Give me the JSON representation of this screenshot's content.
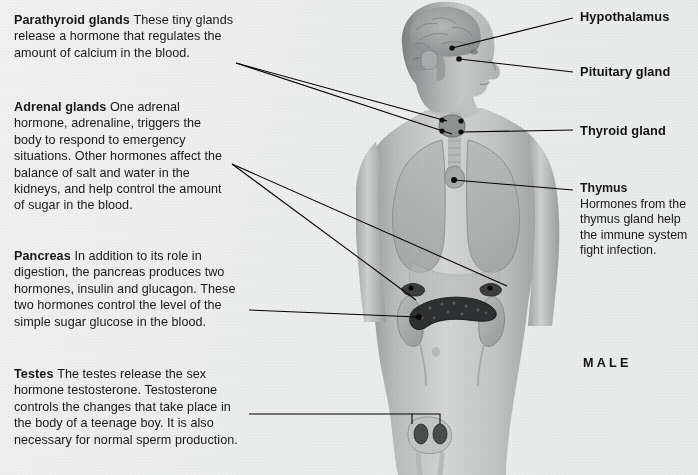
{
  "page": {
    "background_color": "#ececec",
    "figure_caption": "MALE",
    "text_color": "#17181a"
  },
  "left_callouts": [
    {
      "id": "parathyroid",
      "heading": "Parathyroid glands",
      "body": "These tiny glands release a hormone that regulates the amount of calcium in the blood."
    },
    {
      "id": "adrenal",
      "heading": "Adrenal glands",
      "body": "One adrenal hormone, adrenaline, triggers the body to respond to emergency situations. Other hormones affect the balance of salt and water in the kidneys, and help control the amount of sugar in the blood."
    },
    {
      "id": "pancreas",
      "heading": "Pancreas",
      "body": "In addition to its role in digestion, the pancreas produces two hormones, insulin and glucagon. These two hormones control the level of the simple sugar glucose in the blood."
    },
    {
      "id": "testes",
      "heading": "Testes",
      "body": "The testes release the sex hormone testosterone. Testosterone controls the changes that take place in the body of a teenage boy. It is also necessary for normal sperm production."
    }
  ],
  "right_labels": [
    {
      "id": "hypothalamus",
      "label": "Hypothalamus"
    },
    {
      "id": "pituitary",
      "label": "Pituitary gland"
    },
    {
      "id": "thyroid",
      "label": "Thyroid gland"
    }
  ],
  "right_block": {
    "id": "thymus",
    "heading": "Thymus",
    "body": "Hormones from the thymus gland help the immune system fight infection."
  },
  "figure": {
    "name": "male-endocrine-system-figure",
    "view": "anterior body with head in right profile",
    "organs_shown": [
      "brain",
      "hypothalamus",
      "pituitary gland",
      "thyroid gland",
      "parathyroid glands",
      "thymus",
      "lungs",
      "trachea",
      "adrenal glands",
      "kidneys",
      "pancreas",
      "testes"
    ]
  }
}
